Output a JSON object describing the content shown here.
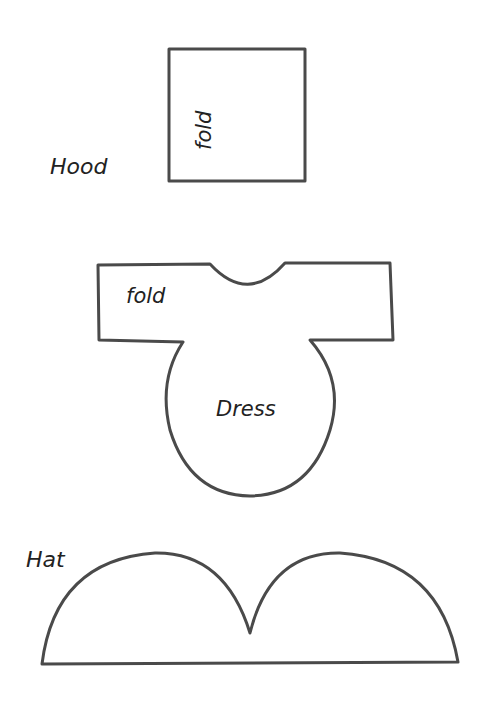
{
  "diagram": {
    "type": "sewing-pattern",
    "pieces": [
      {
        "name": "Hood",
        "label": "Hood",
        "fold_label": "fold"
      },
      {
        "name": "Dress",
        "label": "Dress",
        "fold_label": "fold"
      },
      {
        "name": "Hat",
        "label": "Hat"
      }
    ],
    "colors": {
      "line": "#4a4a4a",
      "text": "#222222",
      "background": "#ffffff"
    }
  }
}
